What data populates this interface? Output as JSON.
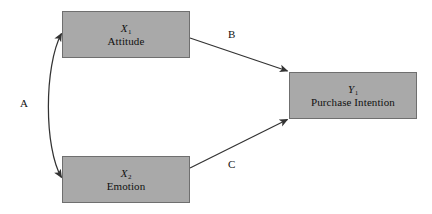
{
  "diagram": {
    "background_color": "#ffffff",
    "node_fill_color": "#a9a9a9",
    "node_border_color": "#6f6f6f",
    "line_color": "#333333",
    "nodes": [
      {
        "id": "x1",
        "symbol_base": "X",
        "symbol_sub": "1",
        "label": "Attitude",
        "x": 62,
        "y": 11,
        "width": 128,
        "height": 47
      },
      {
        "id": "x2",
        "symbol_base": "X",
        "symbol_sub": "2",
        "label": "Emotion",
        "x": 62,
        "y": 156,
        "width": 128,
        "height": 47
      },
      {
        "id": "y1",
        "symbol_base": "Y",
        "symbol_sub": "1",
        "label": "Purchase Intention",
        "x": 289,
        "y": 72,
        "width": 128,
        "height": 47
      }
    ],
    "edges": [
      {
        "id": "a",
        "label": "A",
        "from": "x2",
        "to": "x1",
        "style": "curved",
        "arrowheads": "both",
        "label_x": 20,
        "label_y": 97
      },
      {
        "id": "b",
        "label": "B",
        "from": "x1",
        "to": "y1",
        "style": "straight",
        "arrowheads": "end",
        "label_x": 228,
        "label_y": 28
      },
      {
        "id": "c",
        "label": "C",
        "from": "x2",
        "to": "y1",
        "style": "straight",
        "arrowheads": "end",
        "label_x": 228,
        "label_y": 158
      }
    ]
  }
}
